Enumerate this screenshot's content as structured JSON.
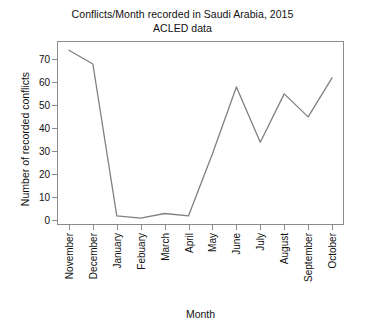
{
  "chart_data": {
    "type": "line",
    "title": "Conflicts/Month recorded in Saudi Arabia, 2015",
    "subtitle": "ACLED data",
    "xlabel": "Month",
    "ylabel": "Number of recorded conflicts",
    "categories": [
      "November",
      "December",
      "January",
      "Febuary",
      "March",
      "April",
      "May",
      "June",
      "July",
      "August",
      "September",
      "October"
    ],
    "values": [
      74,
      68,
      2,
      1,
      3,
      2,
      29,
      58,
      34,
      55,
      45,
      62
    ],
    "series": [
      {
        "name": "Recorded conflicts",
        "values": [
          74,
          68,
          2,
          1,
          3,
          2,
          29,
          58,
          34,
          55,
          45,
          62
        ]
      }
    ],
    "yticks": [
      0,
      10,
      20,
      30,
      40,
      50,
      60,
      70
    ],
    "yticklabels": [
      "0",
      "10",
      "20",
      "30",
      "40",
      "50",
      "60",
      "70"
    ],
    "ylim": [
      -2,
      78
    ],
    "xlim": [
      -0.5,
      11.5
    ],
    "grid": false,
    "legend": false,
    "line_color": "#808080",
    "axis_color": "#8c8c8c",
    "background_color": "#ffffff",
    "text_color": "#111111"
  }
}
